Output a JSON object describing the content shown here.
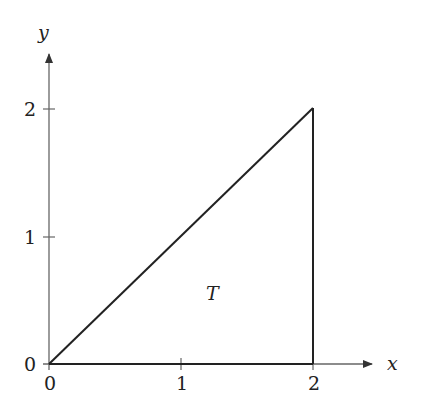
{
  "diagram": {
    "axes": {
      "x_label": "x",
      "y_label": "y",
      "x_ticks": [
        "0",
        "1",
        "2"
      ],
      "y_ticks": [
        "0",
        "1",
        "2"
      ]
    },
    "region_label": "T",
    "triangle_vertices": [
      [
        0,
        0
      ],
      [
        2,
        2
      ],
      [
        2,
        0
      ]
    ],
    "colors": {
      "axis": "#555555",
      "edge": "#222222"
    }
  }
}
